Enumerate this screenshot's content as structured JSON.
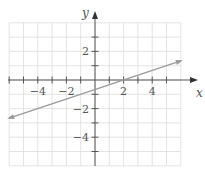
{
  "chart_data": {
    "type": "line",
    "title": "",
    "xlabel": "x",
    "ylabel": "y",
    "xlim": [
      -6,
      6
    ],
    "ylim": [
      -6,
      4
    ],
    "grid": true,
    "x_ticks": [
      -6,
      -5,
      -4,
      -3,
      -2,
      -1,
      1,
      2,
      3,
      4,
      5
    ],
    "y_ticks": [
      -5,
      -4,
      -3,
      -2,
      -1,
      1,
      2,
      3
    ],
    "x_tick_labels": [
      {
        "value": -4,
        "label": "−4"
      },
      {
        "value": -2,
        "label": "−2"
      },
      {
        "value": 2,
        "label": "2"
      },
      {
        "value": 4,
        "label": "4"
      }
    ],
    "y_tick_labels": [
      {
        "value": 2,
        "label": "2"
      },
      {
        "value": -2,
        "label": "−2"
      },
      {
        "value": -4,
        "label": "−4"
      }
    ],
    "series": [
      {
        "name": "line",
        "equation": "y = (1/3)x - 2/3",
        "x": [
          -6,
          6
        ],
        "y": [
          -2.667,
          1.333
        ],
        "arrows_both_ends": true,
        "color": "#9a9a9a"
      }
    ],
    "key_points": [
      {
        "x": 2,
        "y": 0,
        "note": "x-intercept"
      },
      {
        "x": 0,
        "y": -0.667,
        "note": "y-intercept"
      }
    ]
  },
  "colors": {
    "grid": "#dcdcdc",
    "axis": "#555555",
    "line": "#9a9a9a",
    "text": "#555555"
  }
}
